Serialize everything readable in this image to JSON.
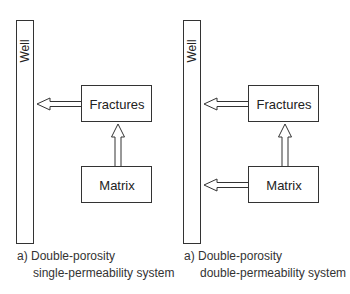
{
  "panels": [
    {
      "well_label": "Well",
      "fractures_label": "Fractures",
      "matrix_label": "Matrix",
      "arrows": [
        "fractures-to-well",
        "matrix-to-fractures"
      ],
      "caption_line1": "a) Double-porosity",
      "caption_line2": "single-permeability system"
    },
    {
      "well_label": "Well",
      "fractures_label": "Fractures",
      "matrix_label": "Matrix",
      "arrows": [
        "fractures-to-well",
        "matrix-to-fractures",
        "matrix-to-well"
      ],
      "caption_line1": "a) Double-porosity",
      "caption_line2": "double-permeability system"
    }
  ]
}
